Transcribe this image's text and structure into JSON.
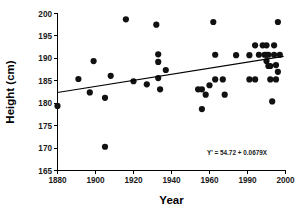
{
  "chart_data": {
    "type": "scatter",
    "title": "",
    "xlabel": "Year",
    "ylabel": "Height (cm)",
    "xlim": [
      1880,
      2000
    ],
    "ylim": [
      165,
      200
    ],
    "grid": false,
    "legend": null,
    "xticks": [
      1880,
      1900,
      1920,
      1940,
      1960,
      1990,
      2000
    ],
    "xtick_labels": [
      "1880",
      "1900",
      "1920",
      "1940",
      "1960",
      "1990",
      "2000"
    ],
    "yticks": [
      165,
      170,
      175,
      180,
      185,
      190,
      195,
      200
    ],
    "ytick_labels": [
      "165",
      "170",
      "175",
      "180",
      "185",
      "190",
      "195",
      "200"
    ],
    "annotation": "Y' = 54.72 + 0.0679X",
    "trendline": {
      "equation": "Y' = 54.72 + 0.0679X",
      "intercept": 54.72,
      "slope": 0.0679,
      "x_start": 1880,
      "y_start": 182.37,
      "x_end": 1999,
      "y_end": 190.45
    },
    "point_color": "#111111",
    "line_color": "#000000",
    "points": [
      {
        "x": 1880,
        "y": 179.4
      },
      {
        "x": 1891,
        "y": 185.4
      },
      {
        "x": 1897,
        "y": 182.4
      },
      {
        "x": 1899,
        "y": 189.4
      },
      {
        "x": 1905,
        "y": 181.2
      },
      {
        "x": 1905,
        "y": 170.3
      },
      {
        "x": 1908,
        "y": 186.1
      },
      {
        "x": 1916,
        "y": 198.7
      },
      {
        "x": 1920,
        "y": 184.9
      },
      {
        "x": 1927,
        "y": 184.2
      },
      {
        "x": 1932,
        "y": 197.5
      },
      {
        "x": 1933,
        "y": 190.9
      },
      {
        "x": 1933,
        "y": 189.2
      },
      {
        "x": 1933,
        "y": 185.6
      },
      {
        "x": 1934,
        "y": 183.1
      },
      {
        "x": 1937,
        "y": 187.4
      },
      {
        "x": 1954,
        "y": 183.1
      },
      {
        "x": 1956,
        "y": 183.1
      },
      {
        "x": 1956,
        "y": 178.7
      },
      {
        "x": 1958,
        "y": 181.9
      },
      {
        "x": 1960,
        "y": 184.0
      },
      {
        "x": 1962,
        "y": 198.1
      },
      {
        "x": 1963,
        "y": 190.8
      },
      {
        "x": 1963,
        "y": 185.3
      },
      {
        "x": 1967,
        "y": 185.3
      },
      {
        "x": 1968,
        "y": 181.9
      },
      {
        "x": 1974,
        "y": 190.7
      },
      {
        "x": 1981,
        "y": 190.7
      },
      {
        "x": 1981,
        "y": 185.3
      },
      {
        "x": 1984,
        "y": 192.9
      },
      {
        "x": 1984,
        "y": 185.3
      },
      {
        "x": 1986,
        "y": 190.8
      },
      {
        "x": 1988,
        "y": 192.9
      },
      {
        "x": 1989,
        "y": 190.8
      },
      {
        "x": 1990,
        "y": 192.9
      },
      {
        "x": 1990,
        "y": 190.8
      },
      {
        "x": 1990,
        "y": 189.4
      },
      {
        "x": 1991,
        "y": 188.3
      },
      {
        "x": 1991,
        "y": 190.8
      },
      {
        "x": 1992,
        "y": 188.3
      },
      {
        "x": 1992,
        "y": 185.3
      },
      {
        "x": 1993,
        "y": 180.4
      },
      {
        "x": 1994,
        "y": 192.9
      },
      {
        "x": 1994,
        "y": 190.8
      },
      {
        "x": 1995,
        "y": 188.5
      },
      {
        "x": 1995,
        "y": 185.3
      },
      {
        "x": 1996,
        "y": 198.1
      },
      {
        "x": 1996,
        "y": 187.0
      },
      {
        "x": 1997,
        "y": 190.8
      }
    ]
  }
}
